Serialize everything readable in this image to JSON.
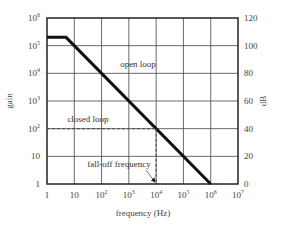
{
  "chart_data": {
    "type": "line",
    "title": "",
    "xlabel": "frequency (Hz)",
    "ylabel": "gain",
    "y2label": "dB",
    "xscale": "log",
    "yscale": "log",
    "xlim": [
      1,
      10000000
    ],
    "ylim": [
      1,
      1000000
    ],
    "y2lim": [
      0,
      120
    ],
    "grid": true,
    "legend": null,
    "x_ticks": [
      {
        "base": "1",
        "exp": ""
      },
      {
        "base": "10",
        "exp": ""
      },
      {
        "base": "10",
        "exp": "2"
      },
      {
        "base": "10",
        "exp": "3"
      },
      {
        "base": "10",
        "exp": "4"
      },
      {
        "base": "10",
        "exp": "5"
      },
      {
        "base": "10",
        "exp": "6"
      },
      {
        "base": "10",
        "exp": "7"
      }
    ],
    "y_ticks": [
      {
        "base": "1",
        "exp": ""
      },
      {
        "base": "10",
        "exp": ""
      },
      {
        "base": "10",
        "exp": "2"
      },
      {
        "base": "10",
        "exp": "3"
      },
      {
        "base": "10",
        "exp": "4"
      },
      {
        "base": "10",
        "exp": "5"
      },
      {
        "base": "10",
        "exp": "6"
      }
    ],
    "y2_ticks": [
      "0",
      "20",
      "40",
      "60",
      "80",
      "100",
      "120"
    ],
    "series": [
      {
        "name": "open loop",
        "style": "solid-thick",
        "points": [
          [
            1,
            200000
          ],
          [
            5,
            200000
          ],
          [
            1000000,
            1
          ]
        ]
      },
      {
        "name": "closed loop",
        "style": "dashed",
        "points": [
          [
            1,
            100
          ],
          [
            10000,
            100
          ]
        ]
      },
      {
        "name": "fall-off marker",
        "style": "dashed",
        "points": [
          [
            10000,
            100
          ],
          [
            10000,
            1
          ]
        ]
      }
    ],
    "annotations": [
      {
        "text": "open loop",
        "x": 1000,
        "y": 8000
      },
      {
        "text": "closed loop",
        "x": 30,
        "y": 200
      },
      {
        "text": "fall-off frequency",
        "x": 1000,
        "y": 3,
        "arrow_to": [
          10000,
          1
        ]
      }
    ]
  },
  "labels": {
    "xlabel": "frequency (Hz)",
    "ylabel": "gain",
    "y2label": "dB",
    "open_loop": "open loop",
    "closed_loop": "closed loop",
    "fall_off": "fall-off frequency"
  }
}
